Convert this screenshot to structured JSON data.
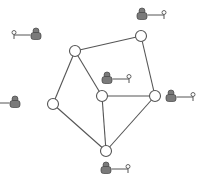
{
  "diagram": {
    "type": "network-graph",
    "colors": {
      "edge": "#555555",
      "node_fill": "#ffffff",
      "node_stroke": "#555555",
      "user_fill": "#7a7a7a",
      "user_stroke": "#444444",
      "key_stroke": "#555555"
    },
    "nodes": [
      {
        "id": "n1",
        "x": 75,
        "y": 51,
        "user": {
          "x": 36,
          "y": 34,
          "key_side": "left"
        }
      },
      {
        "id": "n2",
        "x": 141,
        "y": 36,
        "user": {
          "x": 142,
          "y": 14,
          "key_side": "right"
        }
      },
      {
        "id": "n3",
        "x": 102,
        "y": 96,
        "user": {
          "x": 107,
          "y": 78,
          "key_side": "right"
        }
      },
      {
        "id": "n4",
        "x": 155,
        "y": 96,
        "user": {
          "x": 171,
          "y": 96,
          "key_side": "right"
        }
      },
      {
        "id": "n5",
        "x": 53,
        "y": 104,
        "user": {
          "x": 15,
          "y": 102,
          "key_side": "left"
        }
      },
      {
        "id": "n6",
        "x": 106,
        "y": 151,
        "user": {
          "x": 106,
          "y": 168,
          "key_side": "right"
        }
      }
    ],
    "edges": [
      [
        "n1",
        "n2"
      ],
      [
        "n1",
        "n5"
      ],
      [
        "n1",
        "n3"
      ],
      [
        "n2",
        "n4"
      ],
      [
        "n3",
        "n4"
      ],
      [
        "n3",
        "n6"
      ],
      [
        "n5",
        "n6"
      ],
      [
        "n4",
        "n6"
      ]
    ],
    "icons": {
      "user": "user-lock-icon",
      "key": "key-icon"
    }
  }
}
